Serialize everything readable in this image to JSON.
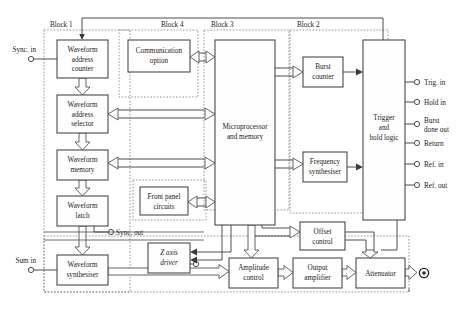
{
  "diagram": {
    "type": "block-diagram",
    "canvas": {
      "width": 465,
      "height": 314
    },
    "colors": {
      "background": "#ffffff",
      "box_stroke": "#4a4a4a",
      "box_fill": "#fefefe",
      "region_stroke": "#8a8a8a",
      "wire": "#3a3a3a",
      "text": "#1a1a1a"
    },
    "regions": [
      {
        "id": "block1",
        "label": "Block 1",
        "label_x": 50,
        "label_y": 27,
        "x": 44,
        "y": 30,
        "w": 86,
        "h": 262
      },
      {
        "id": "block4",
        "label": "Block 4",
        "label_x": 161,
        "label_y": 27,
        "x": 119,
        "y": 30,
        "w": 79,
        "h": 67
      },
      {
        "id": "block3",
        "label": "Block 3",
        "label_x": 211,
        "label_y": 27,
        "x": 204,
        "y": 30,
        "w": 85,
        "h": 180
      },
      {
        "id": "block2",
        "label": "Block 2",
        "label_x": 297,
        "label_y": 27,
        "x": 290,
        "y": 30,
        "w": 98,
        "h": 183
      },
      {
        "id": "frontpanel",
        "label": "",
        "label_x": 0,
        "label_y": 0,
        "x": 133,
        "y": 180,
        "w": 73,
        "h": 40
      },
      {
        "id": "output-chain",
        "label": "",
        "label_x": 0,
        "label_y": 0,
        "x": 44,
        "y": 236,
        "w": 365,
        "h": 56
      }
    ],
    "units": [
      {
        "id": "waveform-address-counter",
        "lines": [
          "Waveform",
          "address",
          "counter"
        ],
        "x": 57,
        "y": 40,
        "w": 51,
        "h": 38
      },
      {
        "id": "waveform-address-selector",
        "lines": [
          "Waveform",
          "address",
          "selector"
        ],
        "x": 57,
        "y": 95,
        "w": 51,
        "h": 38
      },
      {
        "id": "waveform-memory",
        "lines": [
          "Waveform",
          "memory"
        ],
        "x": 57,
        "y": 150,
        "w": 51,
        "h": 30
      },
      {
        "id": "waveform-latch",
        "lines": [
          "Waveform",
          "latch"
        ],
        "x": 57,
        "y": 196,
        "w": 51,
        "h": 30
      },
      {
        "id": "waveform-synthesiser",
        "lines": [
          "Waveform",
          "synthesiser"
        ],
        "x": 57,
        "y": 255,
        "w": 51,
        "h": 30
      },
      {
        "id": "communication-option",
        "lines": [
          "Communication",
          "option"
        ],
        "x": 128,
        "y": 40,
        "w": 62,
        "h": 32
      },
      {
        "id": "front-panel-circuits",
        "lines": [
          "Front panel",
          "circuits"
        ],
        "x": 140,
        "y": 187,
        "w": 48,
        "h": 28
      },
      {
        "id": "microprocessor-and-memory",
        "lines": [
          "Microprocessor",
          "and memory"
        ],
        "x": 215,
        "y": 40,
        "w": 60,
        "h": 185
      },
      {
        "id": "z-axis-driver",
        "lines": [
          "Z axis",
          "driver"
        ],
        "x": 148,
        "y": 243,
        "w": 42,
        "h": 30,
        "italic": true
      },
      {
        "id": "burst-counter",
        "lines": [
          "Burst",
          "counter"
        ],
        "x": 303,
        "y": 57,
        "w": 40,
        "h": 30
      },
      {
        "id": "frequency-synthesiser",
        "lines": [
          "Frequency",
          "synthesiser"
        ],
        "x": 303,
        "y": 152,
        "w": 44,
        "h": 30
      },
      {
        "id": "trigger-and-hold-logic",
        "lines": [
          "Trigger",
          "and",
          "hold logic"
        ],
        "x": 363,
        "y": 40,
        "w": 42,
        "h": 180
      },
      {
        "id": "offset-control",
        "lines": [
          "Offset",
          "control"
        ],
        "x": 300,
        "y": 222,
        "w": 45,
        "h": 28
      },
      {
        "id": "amplitude-control",
        "lines": [
          "Amplitude",
          "control"
        ],
        "x": 229,
        "y": 258,
        "w": 49,
        "h": 30
      },
      {
        "id": "output-amplifier",
        "lines": [
          "Output",
          "amplifier"
        ],
        "x": 293,
        "y": 258,
        "w": 49,
        "h": 30
      },
      {
        "id": "attenuator",
        "lines": [
          "Attenuator"
        ],
        "x": 356,
        "y": 258,
        "w": 49,
        "h": 30
      }
    ],
    "terminals_left": [
      {
        "id": "sync-in",
        "label": "Sync. in",
        "cx": 31,
        "cy": 59,
        "label_x": 26,
        "label_y": 52
      },
      {
        "id": "sum-in",
        "label": "Sum in",
        "cx": 31,
        "cy": 270,
        "label_x": 26,
        "label_y": 263
      }
    ],
    "terminals_mid": [
      {
        "id": "sync-out",
        "label": "Sync. out",
        "cx": 111,
        "cy": 232,
        "label_x": 117,
        "label_y": 234
      },
      {
        "id": "z-axis-out",
        "label": "Z axis out",
        "cx": 196,
        "cy": 264,
        "label_x": 190,
        "label_y": 275,
        "italic": true
      }
    ],
    "terminals_right": [
      {
        "id": "trig-in",
        "label": "Trig. in",
        "cx": 417,
        "cy": 82,
        "label_x": 424,
        "label_y": 84
      },
      {
        "id": "hold-in",
        "label": "Hold in",
        "cx": 417,
        "cy": 102,
        "label_x": 424,
        "label_y": 104
      },
      {
        "id": "burst-done-out",
        "label": "Burst done out",
        "cx": 417,
        "cy": 124,
        "label_x": 424,
        "label_y": 123,
        "two_line": true,
        "line1": "Burst",
        "line2": "done out"
      },
      {
        "id": "return",
        "label": "Return",
        "cx": 417,
        "cy": 143,
        "label_x": 424,
        "label_y": 145
      },
      {
        "id": "ref-in",
        "label": "Ref. in",
        "cx": 417,
        "cy": 164,
        "label_x": 424,
        "label_y": 166
      },
      {
        "id": "ref-out",
        "label": "Ref. out",
        "cx": 417,
        "cy": 185,
        "label_x": 424,
        "label_y": 187
      }
    ],
    "output_connector": {
      "id": "main-output",
      "cx": 424,
      "cy": 273,
      "r_outer": 5,
      "r_inner": 2
    }
  }
}
